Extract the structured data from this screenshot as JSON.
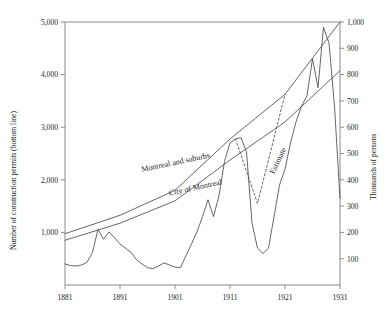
{
  "chart_data": {
    "type": "line",
    "title": "",
    "xlabel": "",
    "ylabel": "Number of construction permits (bottom line)",
    "y2label": "Thousands of persons",
    "xlim": [
      1881,
      1931
    ],
    "ylim": [
      0,
      5000
    ],
    "y2lim": [
      0,
      1000
    ],
    "grid": false,
    "legend": "inline-labels",
    "xticks": [
      "1881",
      "1891",
      "1901",
      "1911",
      "1921",
      "1931"
    ],
    "xtick_values": [
      1881,
      1891,
      1901,
      1911,
      1921,
      1931
    ],
    "yticks": [
      "1,000",
      "2,000",
      "3,000",
      "4,000",
      "5,000"
    ],
    "ytick_values": [
      1000,
      2000,
      3000,
      4000,
      5000
    ],
    "y2ticks": [
      "100",
      "200",
      "300",
      "400",
      "500",
      "600",
      "700",
      "800",
      "900",
      "1,000"
    ],
    "y2tick_values": [
      100,
      200,
      300,
      400,
      500,
      600,
      700,
      800,
      900,
      1000
    ],
    "series": [
      {
        "name": "Number of construction permits",
        "axis": "left",
        "style": "solid",
        "label": "",
        "x": [
          1881,
          1882,
          1883,
          1884,
          1885,
          1886,
          1887,
          1888,
          1889,
          1890,
          1891,
          1892,
          1893,
          1894,
          1895,
          1896,
          1897,
          1898,
          1899,
          1900,
          1901,
          1902,
          1903,
          1904,
          1905,
          1906,
          1907,
          1908,
          1909,
          1910,
          1911,
          1912,
          1913,
          1914,
          1915,
          1916,
          1917,
          1918,
          1919,
          1920,
          1921,
          1922,
          1923,
          1924,
          1925,
          1926,
          1927,
          1928,
          1929,
          1930,
          1931
        ],
        "values": [
          400,
          370,
          360,
          380,
          430,
          620,
          1060,
          870,
          1010,
          900,
          780,
          700,
          620,
          480,
          400,
          330,
          310,
          360,
          420,
          380,
          340,
          330,
          560,
          780,
          1010,
          1300,
          1620,
          1300,
          1700,
          2350,
          2700,
          2780,
          2800,
          2530,
          1180,
          700,
          600,
          700,
          1300,
          1900,
          2200,
          2700,
          3100,
          3400,
          3600,
          4300,
          3750,
          4900,
          4600,
          3400,
          1650
        ]
      },
      {
        "name": "Montreal and suburbs",
        "axis": "right",
        "style": "solid",
        "label": "Montreal and suburbs",
        "x": [
          1881,
          1891,
          1901,
          1911,
          1921,
          1931
        ],
        "values": [
          195,
          265,
          360,
          555,
          725,
          1000
        ]
      },
      {
        "name": "City of Montreal",
        "axis": "right",
        "style": "solid",
        "label": "City of Montreal",
        "x": [
          1881,
          1891,
          1901,
          1911,
          1921,
          1931
        ],
        "values": [
          170,
          235,
          320,
          475,
          620,
          815
        ]
      },
      {
        "name": "Estimate",
        "axis": "right",
        "style": "dashed",
        "label": "Estimate",
        "x": [
          1912,
          1916,
          1921
        ],
        "values": [
          555,
          310,
          725
        ]
      }
    ],
    "annotations": [
      {
        "text": "Montreal and suburbs",
        "x": 1895,
        "y": 430,
        "rotation": -12
      },
      {
        "text": "City of Montreal",
        "x": 1900,
        "y": 340,
        "rotation": -12
      },
      {
        "text": "Estimate",
        "x": 1919,
        "y": 420,
        "rotation": -64
      }
    ]
  },
  "axes": {
    "left_title": "Number of construction permits (bottom line)",
    "right_title": "Thousands of persons"
  }
}
